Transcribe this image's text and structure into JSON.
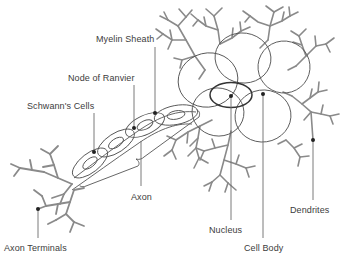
{
  "figure": {
    "background_color": "#ffffff",
    "label_color": "#3c3c3c",
    "outline_color": "#555555",
    "branch_color": "#8a8a8a",
    "leader_color": "#6b6b6b",
    "dot_color": "#222222"
  },
  "labels": {
    "myelin_sheath": "Myelin Sheath",
    "node_of_ranvier": "Node of Ranvier",
    "schwanns_cells": "Schwann's Cells",
    "axon": "Axon",
    "axon_terminals": "Axon Terminals",
    "nucleus": "Nucleus",
    "cell_body": "Cell Body",
    "dendrites": "Dendrites"
  },
  "label_positions": {
    "myelin_sheath": {
      "x": 96,
      "y": 34
    },
    "node_of_ranvier": {
      "x": 68,
      "y": 73
    },
    "schwanns_cells": {
      "x": 27,
      "y": 101
    },
    "axon": {
      "x": 131,
      "y": 192
    },
    "axon_terminals": {
      "x": 4,
      "y": 243
    },
    "nucleus": {
      "x": 209,
      "y": 225
    },
    "cell_body": {
      "x": 244,
      "y": 243
    },
    "dendrites": {
      "x": 290,
      "y": 205
    }
  },
  "leaders": [
    {
      "name": "myelin-sheath-leader",
      "x1": 155,
      "y1": 47,
      "x2": 155,
      "y2": 113
    },
    {
      "name": "node-of-ranvier-leader",
      "x1": 134,
      "y1": 85,
      "x2": 134,
      "y2": 128
    },
    {
      "name": "schwanns-cells-leader",
      "x1": 94,
      "y1": 113,
      "x2": 94,
      "y2": 152
    },
    {
      "name": "axon-leader",
      "x1": 141,
      "y1": 141,
      "x2": 141,
      "y2": 186
    },
    {
      "name": "axon-terminals-leader",
      "x1": 38,
      "y1": 209,
      "x2": 38,
      "y2": 236
    },
    {
      "name": "nucleus-leader",
      "x1": 231,
      "y1": 96,
      "x2": 231,
      "y2": 218
    },
    {
      "name": "cell-body-leader",
      "x1": 263,
      "y1": 94,
      "x2": 263,
      "y2": 236
    },
    {
      "name": "dendrites-leader",
      "x1": 313,
      "y1": 140,
      "x2": 313,
      "y2": 198
    }
  ],
  "anchor_dots": [
    {
      "name": "myelin-sheath-anchor",
      "cx": 155,
      "cy": 113
    },
    {
      "name": "node-of-ranvier-anchor",
      "cx": 134,
      "cy": 128
    },
    {
      "name": "schwanns-cells-anchor",
      "cx": 94,
      "cy": 152
    },
    {
      "name": "axon-terminals-anchor",
      "cx": 38,
      "cy": 209
    },
    {
      "name": "nucleus-anchor",
      "cx": 231,
      "cy": 96
    },
    {
      "name": "cell-body-anchor",
      "cx": 263,
      "cy": 94
    },
    {
      "name": "dendrites-anchor",
      "cx": 313,
      "cy": 140
    }
  ],
  "structures": {
    "myelin_segments": 4,
    "soma_lobes": 5,
    "nucleus_shape": "ellipse",
    "dendrite_trees": 6,
    "axon_terminal_trees": 2
  }
}
